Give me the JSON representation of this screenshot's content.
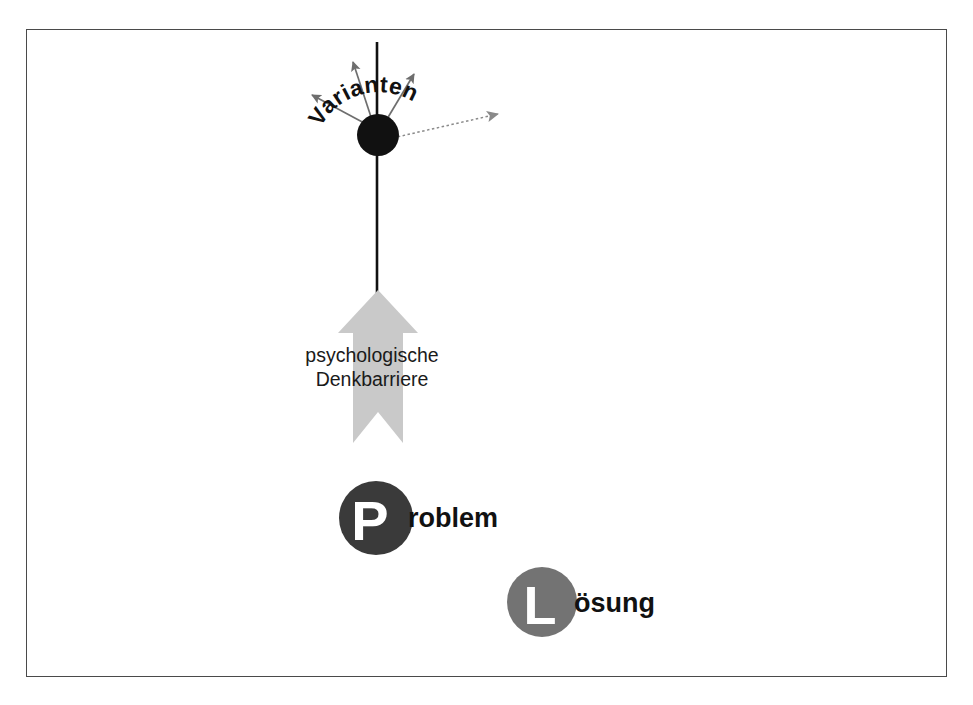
{
  "figure": {
    "title_text": "",
    "frame": {
      "border_color": "#4a4a4a"
    },
    "background_color": "#ffffff"
  },
  "diagram_data": {
    "type": "diagram",
    "language": "de",
    "nodes": [
      {
        "id": "varianten",
        "label": "Varianten",
        "shape": "filled-circle",
        "color": "#111111",
        "center": [
          378,
          135
        ],
        "radius": 21,
        "label_style": "curved-arc-above"
      },
      {
        "id": "problem",
        "letter": "P",
        "label": "roblem",
        "full_label": "Problem",
        "shape": "filled-circle-with-letter",
        "color": "#3a3a3a",
        "letter_color": "#ffffff",
        "text_color": "#111111",
        "center": [
          376,
          518
        ],
        "radius": 37
      },
      {
        "id": "loesung",
        "letter": "L",
        "label": "ösung",
        "full_label": "Lösung",
        "shape": "filled-circle-with-letter",
        "color": "#737373",
        "letter_color": "#ffffff",
        "text_color": "#111111",
        "center": [
          542,
          602
        ],
        "radius": 35
      }
    ],
    "barrier": {
      "label_line1": "psychologische",
      "label_line2": "Denkbarriere",
      "shape": "block-arrow-up-with-notched-tail",
      "color": "#c9c9c9",
      "direction": "up",
      "from": [
        378,
        443
      ],
      "to": [
        378,
        292
      ]
    },
    "connector": {
      "id": "vertical-axis",
      "shape": "line",
      "color": "#111111",
      "from": [
        377,
        42
      ],
      "to": [
        377,
        293
      ]
    },
    "variant_arrows": [
      {
        "id": "arrow-upper-left",
        "from": [
          378,
          135
        ],
        "to": [
          310,
          93
        ],
        "style": "solid"
      },
      {
        "id": "arrow-up-left",
        "from": [
          378,
          135
        ],
        "to": [
          352,
          59
        ],
        "style": "solid"
      },
      {
        "id": "arrow-up-right",
        "from": [
          378,
          135
        ],
        "to": [
          416,
          71
        ],
        "style": "solid"
      },
      {
        "id": "arrow-right",
        "from": [
          382,
          140
        ],
        "to": [
          503,
          113
        ],
        "style": "dotted"
      }
    ]
  }
}
